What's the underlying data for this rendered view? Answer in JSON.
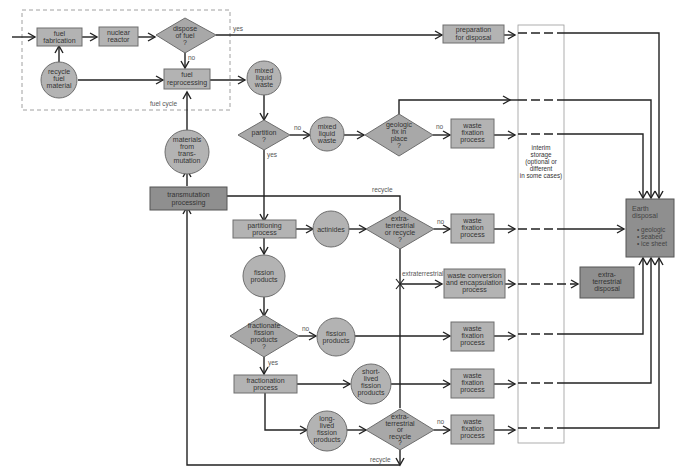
{
  "diagram": {
    "fuel_cycle_label": "fuel cycle",
    "nodes": {
      "fuel_fabrication": [
        "fuel",
        "fabrication"
      ],
      "nuclear_reactor": [
        "nuclear",
        "reactor"
      ],
      "dispose_of_fuel": [
        "dispose",
        "of fuel",
        "?"
      ],
      "recycle_fuel_material": [
        "recycle",
        "fuel",
        "material"
      ],
      "fuel_reprocessing": [
        "fuel",
        "reprocessing"
      ],
      "preparation_for_disposal": [
        "preparation",
        "for disposal"
      ],
      "mixed_liquid_waste_1": [
        "mixed",
        "liquid",
        "waste"
      ],
      "partition": [
        "partition",
        "?"
      ],
      "mixed_liquid_waste_2": [
        "mixed",
        "liquid",
        "waste"
      ],
      "geologic_fix": [
        "geologic",
        "fix in",
        "place",
        "?"
      ],
      "waste_fixation_1": [
        "waste",
        "fixation",
        "process"
      ],
      "materials_from_transmutation": [
        "materials",
        "from",
        "trans-",
        "mutation"
      ],
      "transmutation_processing": [
        "transmutation",
        "processing"
      ],
      "partitioning_process": [
        "partitioning",
        "process"
      ],
      "actinides": [
        "actinides"
      ],
      "extraterrestrial_or_recycle_1": [
        "extra-",
        "terrestrial",
        "or recycle",
        "?"
      ],
      "waste_fixation_2": [
        "waste",
        "fixation",
        "process"
      ],
      "fission_products_1": [
        "fission",
        "products"
      ],
      "waste_conversion": [
        "waste conversion",
        "and encapsulation",
        "process"
      ],
      "extraterrestrial_disposal": [
        "extra-",
        "terrestrial",
        "disposal"
      ],
      "fractionate_fission_products": [
        "fractionate",
        "fission",
        "products",
        "?"
      ],
      "fission_products_2": [
        "fission",
        "products"
      ],
      "waste_fixation_3": [
        "waste",
        "fixation",
        "process"
      ],
      "fractionation_process": [
        "fractionation",
        "process"
      ],
      "short_lived_fission_products": [
        "short-",
        "lived",
        "fission",
        "products"
      ],
      "waste_fixation_4": [
        "waste",
        "fixation",
        "process"
      ],
      "long_lived_fission_products": [
        "long-",
        "lived",
        "fission",
        "products"
      ],
      "extraterrestrial_or_recycle_2": [
        "extra-",
        "terrestrial",
        "or",
        "recycle",
        "?"
      ],
      "waste_fixation_5": [
        "waste",
        "fixation",
        "process"
      ],
      "interim_storage": [
        "interim",
        "storage",
        "(optional or",
        "different",
        "in some cases)"
      ],
      "earth_disposal_title": [
        "Earth",
        "disposal"
      ],
      "earth_disposal_items": [
        "geologic",
        "seabed",
        "ice sheet"
      ]
    },
    "edge_labels": {
      "yes_dispose": "yes",
      "no_dispose": "no",
      "no_partition": "no",
      "yes_partition": "yes",
      "no_geologic": "no",
      "recycle_top": "recycle",
      "no_extra_1": "no",
      "extraterrestrial": "extraterrestrial",
      "no_fractionate": "no",
      "yes_fractionate": "yes",
      "no_extra_2": "no",
      "recycle_bottom": "recycle"
    },
    "colors": {
      "node_fill": "#b3b3b3",
      "dark_node_fill": "#8f8f8f",
      "line": "#222222"
    }
  }
}
